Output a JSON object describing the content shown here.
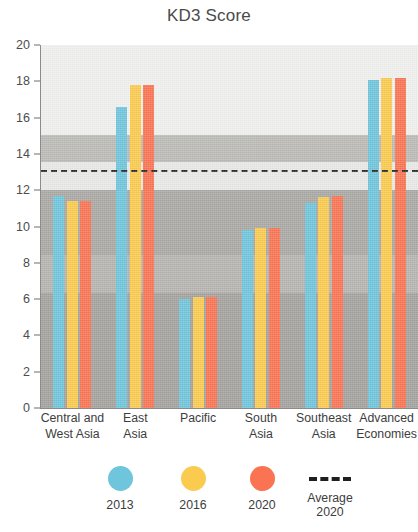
{
  "chart_data": {
    "type": "bar",
    "title": "KD3 Score",
    "xlabel": "",
    "ylabel": "",
    "ylim": [
      0,
      20
    ],
    "yticks": [
      0,
      2,
      4,
      6,
      8,
      10,
      12,
      14,
      16,
      18,
      20
    ],
    "grid": false,
    "legend_position": "bottom",
    "categories": [
      "Central and\nWest Asia",
      "East\nAsia",
      "Pacific",
      "South\nAsia",
      "Southeast\nAsia",
      "Advanced\nEconomies"
    ],
    "series": [
      {
        "name": "2013",
        "color": "#6FC5DC",
        "values": [
          11.7,
          16.6,
          6.0,
          9.8,
          11.3,
          18.1
        ]
      },
      {
        "name": "2016",
        "color": "#FBCB4F",
        "values": [
          11.4,
          17.8,
          6.1,
          9.9,
          11.6,
          18.2
        ]
      },
      {
        "name": "2020",
        "color": "#FA7352",
        "values": [
          11.4,
          17.8,
          6.1,
          9.9,
          11.7,
          18.2
        ]
      }
    ],
    "annotations": [
      {
        "name": "Average 2020",
        "type": "hline",
        "value": 13.1,
        "style": "dashed",
        "color": "#2B2B2B"
      }
    ]
  },
  "legend": {
    "items": [
      {
        "label": "2013",
        "icon": "circle-swatch-icon"
      },
      {
        "label": "2016",
        "icon": "circle-swatch-icon"
      },
      {
        "label": "2020",
        "icon": "circle-swatch-icon"
      },
      {
        "label": "Average\n2020",
        "icon": "dashed-line-icon"
      }
    ]
  }
}
